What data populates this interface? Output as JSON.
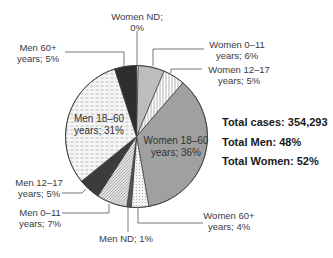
{
  "chart_data": {
    "type": "pie",
    "title": "",
    "start": "top",
    "direction": "clockwise",
    "slices": [
      {
        "name": "Women ND",
        "value": 0.4,
        "label_line1": "Women ND;",
        "label_line2": "0%",
        "fill": "#ffffff",
        "pattern": "none"
      },
      {
        "name": "Women 0–11 years",
        "value": 6,
        "label_line1": "Women 0–11",
        "label_line2": "years; 6%",
        "fill": "#bdbdbd",
        "pattern": "none"
      },
      {
        "name": "Women 12–17 years",
        "value": 5,
        "label_line1": "Women 12–17",
        "label_line2": "years; 5%",
        "fill": "#ffffff",
        "pattern": "vertical-lines"
      },
      {
        "name": "Women 18–60 years",
        "value": 36,
        "label_line1": "Women 18–60",
        "label_line2": "years; 36%",
        "fill": "#a0a0a0",
        "pattern": "none"
      },
      {
        "name": "Women 60+ years",
        "value": 4,
        "label_line1": "Women 60+",
        "label_line2": "years; 4%",
        "fill": "#f2f2f2",
        "pattern": "dots"
      },
      {
        "name": "Men ND",
        "value": 1,
        "label_line1": "Men ND; 1%",
        "label_line2": "",
        "fill": "#555555",
        "pattern": "none"
      },
      {
        "name": "Men 0–11 years",
        "value": 7,
        "label_line1": "Men 0–11",
        "label_line2": "years; 7%",
        "fill": "#d8d8d8",
        "pattern": "diagonal"
      },
      {
        "name": "Men 12–17 years",
        "value": 5,
        "label_line1": "Men 12–17",
        "label_line2": "years; 5%",
        "fill": "#3c3c3c",
        "pattern": "none"
      },
      {
        "name": "Men 18–60 years",
        "value": 31,
        "label_line1": "Men 18–60",
        "label_line2": "years; 31%",
        "fill": "#f4f4f4",
        "pattern": "dashes"
      },
      {
        "name": "Men 60+ years",
        "value": 5,
        "label_line1": "Men 60+",
        "label_line2": "years; 5%",
        "fill": "#2e2e2e",
        "pattern": "none"
      }
    ],
    "annotations": {
      "total_cases": "Total cases: 354,293",
      "total_men": "Total Men: 48%",
      "total_women": "Total Women: 52%"
    }
  }
}
